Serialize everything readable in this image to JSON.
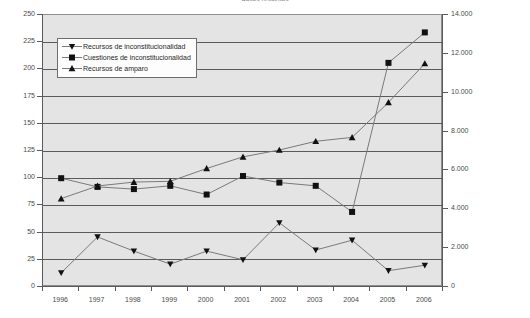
{
  "title": "Casos resueltos",
  "legend": {
    "items": [
      {
        "label": "Recursos de inconstitucionalidad",
        "marker": "triangle-down-marker"
      },
      {
        "label": "Cuestiones de inconstitucionalidad",
        "marker": "square-marker"
      },
      {
        "label": "Recursos de amparo",
        "marker": "triangle-up-marker"
      }
    ]
  },
  "axes": {
    "left_ticks": [
      "250",
      "225",
      "200",
      "175",
      "150",
      "125",
      "100",
      "75",
      "50",
      "25",
      "0"
    ],
    "right_ticks": [
      "14.000",
      "12.000",
      "10.000",
      "8.000",
      "6.000",
      "4.000",
      "2.000",
      "0"
    ],
    "x_ticks": [
      "1996",
      "1997",
      "1998",
      "1999",
      "2000",
      "2001",
      "2002",
      "2003",
      "2004",
      "2005",
      "2006"
    ]
  },
  "colors": {
    "plot_background": "#e4e4e4",
    "gridline": "#5a5a5a",
    "series_line": "#7a7a7a",
    "marker": "#111111",
    "axis": "#5a5a5a",
    "page_background": "#ffffff"
  },
  "chart_data": {
    "type": "line",
    "title": "Casos resueltos",
    "xlabel": "",
    "ylabel": "",
    "grid": true,
    "legend_position": "upper-left-inside",
    "x": [
      1996,
      1997,
      1998,
      1999,
      2000,
      2001,
      2002,
      2003,
      2004,
      2005,
      2006
    ],
    "categories": [
      "1996",
      "1997",
      "1998",
      "1999",
      "2000",
      "2001",
      "2002",
      "2003",
      "2004",
      "2005",
      "2006"
    ],
    "axes": {
      "left": {
        "label": "",
        "ylim": [
          0,
          250
        ],
        "tick_step": 25
      },
      "right": {
        "label": "",
        "ylim": [
          0,
          14000
        ],
        "tick_step": 2000,
        "tick_format": "14.000"
      }
    },
    "series": [
      {
        "name": "Recursos de inconstitucionalidad",
        "axis": "left",
        "marker": "triangle-down",
        "values": [
          13,
          46,
          33,
          21,
          33,
          25,
          59,
          34,
          43,
          15,
          20
        ]
      },
      {
        "name": "Cuestiones de inconstitucionalidad",
        "axis": "left",
        "marker": "square",
        "values": [
          100,
          92,
          90,
          93,
          85,
          102,
          96,
          93,
          69,
          206,
          234
        ]
      },
      {
        "name": "Recursos de amparo",
        "axis": "right",
        "marker": "triangle-up",
        "values": [
          4550,
          5200,
          5400,
          5440,
          6100,
          6700,
          7050,
          7500,
          7700,
          9500,
          11500
        ]
      }
    ]
  }
}
